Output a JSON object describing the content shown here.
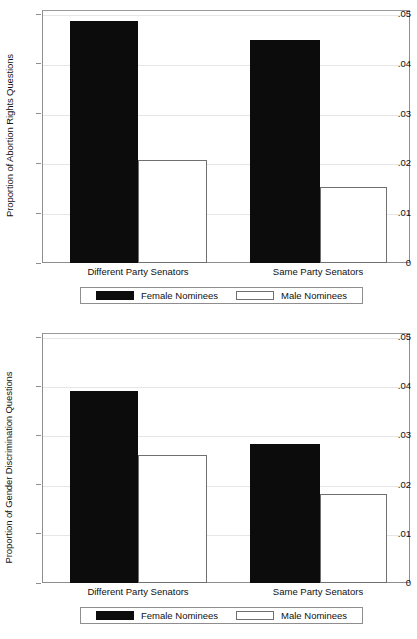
{
  "chart_data": [
    {
      "type": "bar",
      "title": "",
      "xlabel": "",
      "ylabel": "Proportion of Abortion Rights Questions",
      "categories": [
        "Different Party Senators",
        "Same Party Senators"
      ],
      "series": [
        {
          "name": "Female Nominees",
          "color": "#0c0c0c",
          "values": [
            0.0486,
            0.0448
          ]
        },
        {
          "name": "Male Nominees",
          "color": "#ffffff",
          "values": [
            0.0207,
            0.0153
          ]
        }
      ],
      "ylim": [
        0,
        0.05
      ],
      "yticks": [
        0,
        0.01,
        0.02,
        0.03,
        0.04,
        0.05
      ],
      "ytick_labels": [
        "0",
        ".01",
        ".02",
        ".03",
        ".04",
        ".05"
      ],
      "grid": true,
      "legend_position": "below"
    },
    {
      "type": "bar",
      "title": "",
      "xlabel": "",
      "ylabel": "Proportion of Gender Discrimination Questions",
      "categories": [
        "Different Party Senators",
        "Same Party Senators"
      ],
      "series": [
        {
          "name": "Female Nominees",
          "color": "#0c0c0c",
          "values": [
            0.0391,
            0.0283
          ]
        },
        {
          "name": "Male Nominees",
          "color": "#ffffff",
          "values": [
            0.026,
            0.018
          ]
        }
      ],
      "ylim": [
        0,
        0.05
      ],
      "yticks": [
        0,
        0.01,
        0.02,
        0.03,
        0.04,
        0.05
      ],
      "ytick_labels": [
        "0",
        ".01",
        ".02",
        ".03",
        ".04",
        ".05"
      ],
      "grid": true,
      "legend_position": "below"
    }
  ]
}
